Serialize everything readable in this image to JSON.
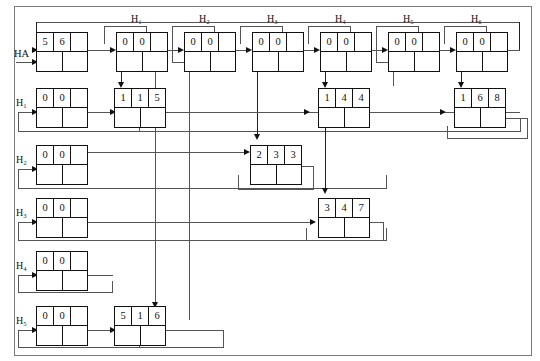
{
  "diagram": {
    "entry_label": "HA",
    "header_row": {
      "labels": [
        "H₁",
        "H₂",
        "H₃",
        "H₄",
        "H₅",
        "H₆"
      ],
      "nodes": [
        {
          "id": "hdr1",
          "top": [
            "0",
            "0",
            ""
          ],
          "bot": [
            "",
            ""
          ]
        },
        {
          "id": "hdr2",
          "top": [
            "0",
            "0",
            ""
          ],
          "bot": [
            "",
            ""
          ]
        },
        {
          "id": "hdr3",
          "top": [
            "0",
            "0",
            ""
          ],
          "bot": [
            "",
            ""
          ]
        },
        {
          "id": "hdr4",
          "top": [
            "0",
            "0",
            ""
          ],
          "bot": [
            "",
            ""
          ]
        },
        {
          "id": "hdr5",
          "top": [
            "0",
            "0",
            ""
          ],
          "bot": [
            "",
            ""
          ]
        },
        {
          "id": "hdr6",
          "top": [
            "0",
            "0",
            ""
          ],
          "bot": [
            "",
            ""
          ]
        }
      ]
    },
    "entry_node": {
      "id": "entry",
      "top": [
        "5",
        "6",
        ""
      ],
      "bot": [
        "",
        ""
      ]
    },
    "left_column": {
      "labels": [
        "H₁",
        "H₂",
        "H₃",
        "H₄",
        "H₅"
      ],
      "nodes": [
        {
          "id": "left1",
          "top": [
            "0",
            "0",
            ""
          ],
          "bot": [
            "",
            ""
          ]
        },
        {
          "id": "left2",
          "top": [
            "0",
            "0",
            ""
          ],
          "bot": [
            "",
            ""
          ]
        },
        {
          "id": "left3",
          "top": [
            "0",
            "0",
            ""
          ],
          "bot": [
            "",
            ""
          ]
        },
        {
          "id": "left4",
          "top": [
            "0",
            "0",
            ""
          ],
          "bot": [
            "",
            ""
          ]
        },
        {
          "id": "left5",
          "top": [
            "0",
            "0",
            ""
          ],
          "bot": [
            "",
            ""
          ]
        }
      ]
    },
    "data_nodes": [
      {
        "id": "d115",
        "top": [
          "1",
          "1",
          "5"
        ],
        "bot": [
          "",
          ""
        ]
      },
      {
        "id": "d144",
        "top": [
          "1",
          "4",
          "4"
        ],
        "bot": [
          "",
          ""
        ]
      },
      {
        "id": "d168",
        "top": [
          "1",
          "6",
          "8"
        ],
        "bot": [
          "",
          ""
        ]
      },
      {
        "id": "d233",
        "top": [
          "2",
          "3",
          "3"
        ],
        "bot": [
          "",
          ""
        ]
      },
      {
        "id": "d347",
        "top": [
          "3",
          "4",
          "7"
        ],
        "bot": [
          "",
          ""
        ]
      },
      {
        "id": "d516",
        "top": [
          "5",
          "1",
          "6"
        ],
        "bot": [
          "",
          ""
        ]
      }
    ],
    "colors": {
      "line": "#555555",
      "node_border": "#111111",
      "frame": "#7a7a7a",
      "background": "#ffffff"
    }
  }
}
